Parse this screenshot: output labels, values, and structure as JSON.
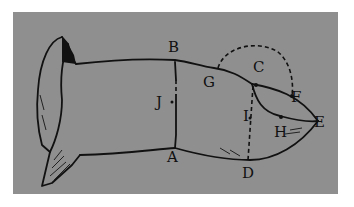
{
  "diagram": {
    "background_color": "#8f8f8f",
    "line_color": "#111111",
    "labels": [
      {
        "id": "A",
        "text": "A",
        "x": 167,
        "y": 162
      },
      {
        "id": "B",
        "text": "B",
        "x": 168,
        "y": 52
      },
      {
        "id": "C",
        "text": "C",
        "x": 253,
        "y": 72
      },
      {
        "id": "D",
        "text": "D",
        "x": 242,
        "y": 178
      },
      {
        "id": "E",
        "text": "E",
        "x": 314,
        "y": 127
      },
      {
        "id": "F",
        "text": "F",
        "x": 291,
        "y": 102
      },
      {
        "id": "G",
        "text": "G",
        "x": 203,
        "y": 87
      },
      {
        "id": "H",
        "text": "H",
        "x": 274,
        "y": 137
      },
      {
        "id": "I",
        "text": "I",
        "x": 243,
        "y": 121
      },
      {
        "id": "J",
        "text": "J",
        "x": 156,
        "y": 107
      }
    ]
  }
}
